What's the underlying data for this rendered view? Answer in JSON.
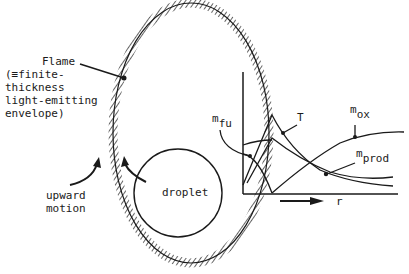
{
  "labels": {
    "flame": [
      "Flame",
      "(≡finite-",
      "thickness",
      "light-emitting",
      "envelope)"
    ],
    "upward_motion": [
      "upward",
      "motion"
    ],
    "droplet": "droplet",
    "T": "T",
    "m_fu": {
      "base": "m",
      "sub": "fu"
    },
    "m_ox": {
      "base": "m",
      "sub": "ox"
    },
    "m_prod": {
      "base": "m",
      "sub": "prod"
    },
    "r_axis": "r"
  },
  "colors": {
    "ink": "#1a1a1a",
    "background": "#ffffff"
  }
}
